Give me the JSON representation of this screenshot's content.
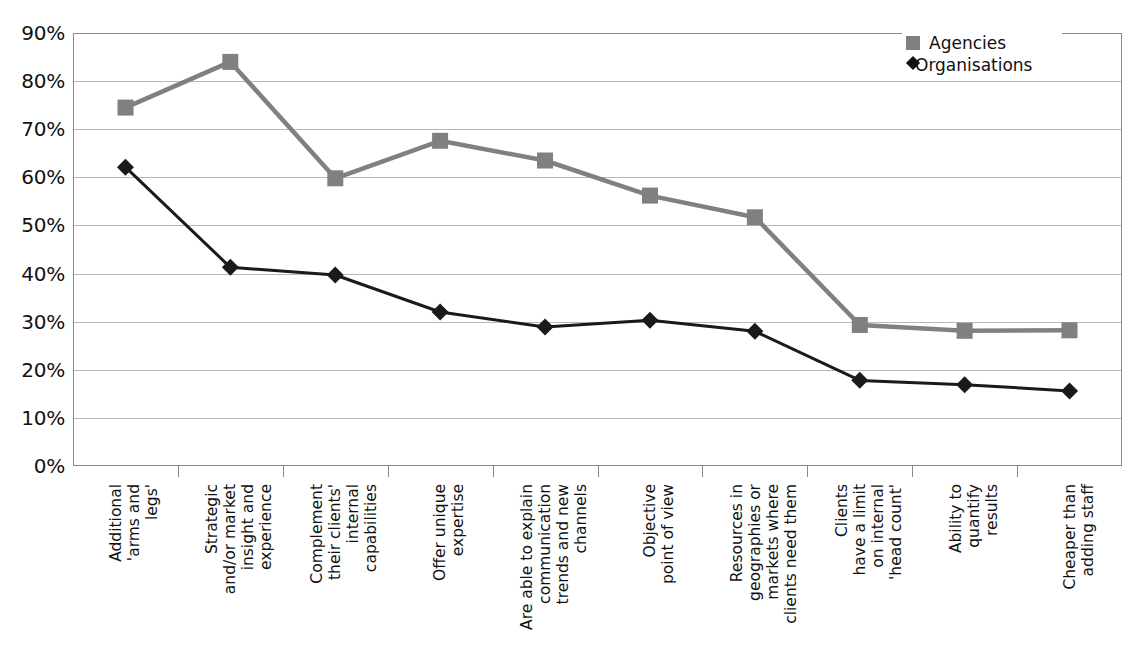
{
  "chart_data": {
    "type": "line",
    "title": "",
    "xlabel": "",
    "ylabel": "",
    "ylim": [
      0,
      90
    ],
    "ytick_step": 10,
    "grid": true,
    "legend_position": "top-right",
    "y_ticks": [
      "0%",
      "10%",
      "20%",
      "30%",
      "40%",
      "50%",
      "60%",
      "70%",
      "80%",
      "90%"
    ],
    "categories": [
      "Additional\n'arms and\nlegs'",
      "Strategic\nand/or market\ninsight and\nexperience",
      "Complement\ntheir clients'\ninternal\ncapabilities",
      "Offer unique\nexpertise",
      "Are able to explain\ncommunication\ntrends and new\nchannels",
      "Objective\npoint of view",
      "Resources in\ngeographies or\nmarkets where\nclients need them",
      "Clients\nhave a limit\non internal\n'head count'",
      "Ability to\nquantify\nresults",
      "Cheaper than\nadding staff"
    ],
    "series": [
      {
        "name": "Agencies",
        "color": "#808080",
        "marker": "square",
        "values": [
          74.5,
          84.0,
          59.8,
          67.6,
          63.5,
          56.2,
          51.7,
          29.3,
          28.1,
          28.2
        ]
      },
      {
        "name": "Organisations",
        "color": "#1a1a1a",
        "marker": "diamond",
        "values": [
          62.1,
          41.3,
          39.7,
          32.0,
          28.9,
          30.3,
          28.0,
          17.8,
          16.9,
          15.6
        ]
      }
    ]
  },
  "legend": {
    "items": [
      {
        "label": "Agencies",
        "marker": "square-marker-icon"
      },
      {
        "label": "Organisations",
        "marker": "diamond-marker-icon"
      }
    ]
  }
}
